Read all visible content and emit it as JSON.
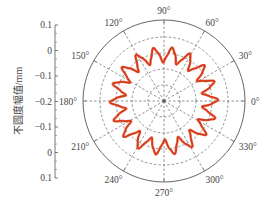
{
  "chart_data": {
    "type": "polar-line",
    "title": "",
    "ylabel": "不圆度幅值/mm",
    "radial_axis": {
      "tick_labels": [
        "0.1",
        "0",
        "-0.1",
        "-0.2",
        "-0.1",
        "0",
        "0.1"
      ],
      "rings": [
        -0.2,
        -0.1,
        0,
        0.1
      ],
      "range": [
        -0.2,
        0.15
      ]
    },
    "angular_axis": {
      "tick_labels": [
        "0°",
        "30°",
        "60°",
        "90°",
        "120°",
        "150°",
        "180°",
        "210°",
        "240°",
        "270°",
        "300°",
        "330°"
      ],
      "tick_angles_deg": [
        0,
        30,
        60,
        90,
        120,
        150,
        180,
        210,
        240,
        270,
        300,
        330
      ]
    },
    "series": [
      {
        "name": "roundness deviation",
        "color": "#e8461e",
        "core_color": "#b3220f",
        "lobes": 18,
        "mean_value": 0.0,
        "amplitude": 0.03,
        "description": "Closed polar curve around radius ≈ 0 mm with ~18 sinusoidal lobes, amplitude ≈ ±0.03 mm"
      }
    ],
    "grid": {
      "rings_dashed": true,
      "spokes_every_deg": 30,
      "color": "#555555"
    }
  }
}
